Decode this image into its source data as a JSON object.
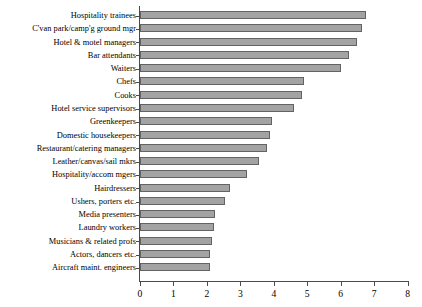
{
  "chart_data": {
    "type": "bar",
    "orientation": "horizontal",
    "title": "",
    "subtitle": "",
    "xlabel": "",
    "ylabel": "",
    "xlim": [
      0,
      8
    ],
    "xticks": [
      "0",
      "1",
      "2",
      "3",
      "4",
      "5",
      "6",
      "7",
      "8"
    ],
    "grid": false,
    "legend": "none",
    "bar_color": "#a3a3a3",
    "bar_border_color": "#636363",
    "axis_color": "#4a4a4a",
    "categories": [
      "Hospitality trainees",
      "C'van park/camp'g ground mgr",
      "Hotel & motel managers",
      "Bar attendants",
      "Waiters",
      "Chefs",
      "Cooks",
      "Hotel service supervisors",
      "Greenkeepers",
      "Domestic housekeepers",
      "Restaurant/catering managers",
      "Leather/canvas/sail mkrs",
      "Hospitality/accom mgers",
      "Hairdressers",
      "Ushers, porters etc.",
      "Media presenters",
      "Laundry workers",
      "Musicians & related profs",
      "Actors, dancers etc.",
      "Aircraft maint. engineers"
    ],
    "values": [
      6.75,
      6.65,
      6.5,
      6.25,
      6.0,
      4.9,
      4.85,
      4.6,
      3.95,
      3.9,
      3.8,
      3.55,
      3.2,
      2.7,
      2.55,
      2.25,
      2.2,
      2.15,
      2.1,
      2.1
    ]
  }
}
